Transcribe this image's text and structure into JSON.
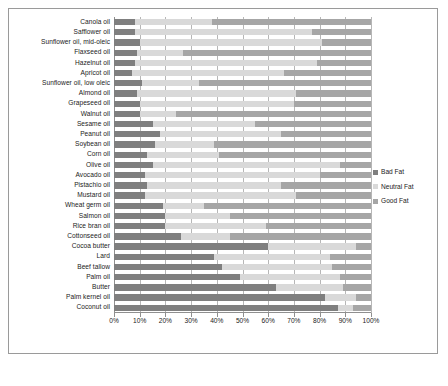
{
  "chart_data": {
    "type": "bar",
    "orientation": "horizontal",
    "stacked": true,
    "stack_mode": "percent",
    "title": "",
    "subtitle": "",
    "xlabel": "",
    "ylabel": "",
    "xlim": [
      0,
      100
    ],
    "xticks": [
      0,
      10,
      20,
      30,
      40,
      50,
      60,
      70,
      80,
      90,
      100
    ],
    "xtick_labels": [
      "0%",
      "10%",
      "20%",
      "30%",
      "40%",
      "50%",
      "60%",
      "70%",
      "80%",
      "90%",
      "100%"
    ],
    "grid": true,
    "grid_axis": "x",
    "legend_position": "right",
    "legend": [
      "Bad Fat",
      "Neutral Fat",
      "Good Fat"
    ],
    "colors": {
      "Bad Fat": "#7f7f7f",
      "Neutral Fat": "#d9d9d9",
      "Good Fat": "#a6a6a6"
    },
    "categories": [
      "Canola oil",
      "Safflower oil",
      "Sunflower oil, mid-oleic",
      "Flaxseed oil",
      "Hazelnut oil",
      "Apricot oil",
      "Sunflower oil, low oleic",
      "Almond oil",
      "Grapeseed oil",
      "Walnut oil",
      "Sesame oil",
      "Peanut oil",
      "Soybean oil",
      "Corn oil",
      "Olive oil",
      "Avocado oil",
      "Pistachio oil",
      "Mustard oil",
      "Wheat germ oil",
      "Salmon oil",
      "Rice bran oil",
      "Cottonseed oil",
      "Cocoa butter",
      "Lard",
      "Beef tallow",
      "Palm oil",
      "Butter",
      "Palm kernel oil",
      "Coconut oil"
    ],
    "series": [
      {
        "name": "Bad Fat",
        "values": [
          8,
          8,
          10,
          9,
          8,
          7,
          11,
          9,
          10,
          10,
          15,
          18,
          16,
          13,
          15,
          12,
          13,
          12,
          19,
          20,
          20,
          26,
          60,
          39,
          42,
          49,
          63,
          82,
          87
        ]
      },
      {
        "name": "Neutral Fat",
        "values": [
          30,
          69,
          71,
          18,
          71,
          59,
          22,
          62,
          60,
          14,
          40,
          47,
          23,
          28,
          73,
          68,
          52,
          59,
          16,
          25,
          39,
          19,
          34,
          45,
          43,
          39,
          26,
          12,
          6
        ]
      },
      {
        "name": "Good Fat",
        "values": [
          62,
          23,
          19,
          73,
          21,
          34,
          67,
          29,
          30,
          76,
          45,
          35,
          61,
          59,
          12,
          20,
          35,
          29,
          65,
          55,
          41,
          55,
          6,
          16,
          15,
          12,
          11,
          6,
          7
        ]
      }
    ]
  }
}
